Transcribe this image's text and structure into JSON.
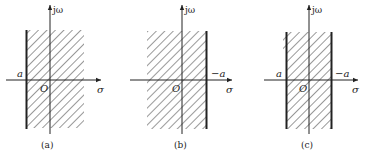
{
  "figure": {
    "colors": {
      "ink": "#222222",
      "hatch": "#444444",
      "background": "#ffffff"
    },
    "axis_labels": {
      "vertical": "jω",
      "horizontal": "σ",
      "origin": "O"
    },
    "panels": [
      {
        "id": "a",
        "caption": "(a)",
        "region": "σ > a (right half-plane to the right of thick line at a)",
        "left_boundary_label": "a",
        "right_boundary_label": ""
      },
      {
        "id": "b",
        "caption": "(b)",
        "region": "σ < −a (left half-plane to the left of thick line at −a)",
        "left_boundary_label": "",
        "right_boundary_label": "−a"
      },
      {
        "id": "c",
        "caption": "(c)",
        "region": "a < σ < −a (strip between two thick lines)",
        "left_boundary_label": "a",
        "right_boundary_label": "−a"
      }
    ]
  }
}
